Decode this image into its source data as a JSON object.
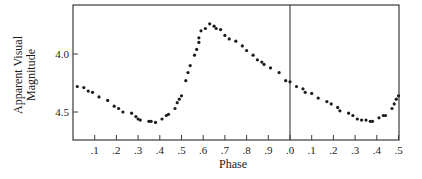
{
  "chart_data": {
    "type": "scatter",
    "title": "",
    "xlabel": "Phase",
    "ylabel": "Apparent Visual Magnitude",
    "ylabel_lines": [
      "Apparent Visual",
      "Magnitude"
    ],
    "xlim": [
      0.0,
      1.5
    ],
    "ylim": [
      4.74,
      3.58
    ],
    "y_inverted": true,
    "grid": false,
    "legend": null,
    "x_ticks": [
      0.1,
      0.2,
      0.3,
      0.4,
      0.5,
      0.6,
      0.7,
      0.8,
      0.9,
      1.0,
      1.1,
      1.2,
      1.3,
      1.4,
      1.5
    ],
    "x_tick_labels": [
      ".1",
      ".2",
      ".3",
      ".4",
      ".5",
      ".6",
      ".7",
      ".8",
      ".9",
      ".0",
      ".1",
      ".2",
      ".3",
      ".4",
      ".5"
    ],
    "y_ticks": [
      4.0,
      4.5
    ],
    "y_tick_labels": [
      "4.0",
      "4.5"
    ],
    "annotations": [
      {
        "type": "vertical-line",
        "x": 1.0,
        "label": "phase zero"
      }
    ],
    "series": [
      {
        "name": "light curve",
        "marker_color": "#1a1a1a",
        "x": [
          0.02,
          0.05,
          0.07,
          0.09,
          0.12,
          0.16,
          0.19,
          0.21,
          0.23,
          0.27,
          0.29,
          0.3,
          0.31,
          0.35,
          0.36,
          0.38,
          0.41,
          0.43,
          0.44,
          0.47,
          0.48,
          0.49,
          0.5,
          0.52,
          0.53,
          0.54,
          0.56,
          0.57,
          0.58,
          0.58,
          0.59,
          0.61,
          0.63,
          0.65,
          0.66,
          0.68,
          0.7,
          0.72,
          0.75,
          0.78,
          0.8,
          0.83,
          0.85,
          0.87,
          0.88,
          0.91,
          0.95,
          0.98,
          1.0,
          1.03,
          1.06,
          1.07,
          1.1,
          1.13,
          1.17,
          1.19,
          1.22,
          1.23,
          1.27,
          1.29,
          1.31,
          1.33,
          1.35,
          1.37,
          1.38,
          1.41,
          1.43,
          1.44,
          1.47,
          1.48,
          1.49,
          1.5
        ],
        "y": [
          4.28,
          4.29,
          4.32,
          4.33,
          4.37,
          4.4,
          4.45,
          4.47,
          4.5,
          4.51,
          4.54,
          4.56,
          4.57,
          4.58,
          4.58,
          4.59,
          4.56,
          4.53,
          4.52,
          4.47,
          4.42,
          4.39,
          4.36,
          4.23,
          4.16,
          4.1,
          4.01,
          3.96,
          3.9,
          3.86,
          3.8,
          3.78,
          3.74,
          3.76,
          3.78,
          3.79,
          3.84,
          3.87,
          3.89,
          3.93,
          3.97,
          4.01,
          4.05,
          4.07,
          4.09,
          4.12,
          4.16,
          4.23,
          4.24,
          4.28,
          4.3,
          4.33,
          4.34,
          4.38,
          4.41,
          4.43,
          4.46,
          4.49,
          4.51,
          4.53,
          4.56,
          4.57,
          4.57,
          4.58,
          4.58,
          4.55,
          4.53,
          4.53,
          4.47,
          4.43,
          4.39,
          4.36
        ]
      }
    ]
  },
  "colors": {
    "axis": "#3a3a3a",
    "marker": "#1a1a1a",
    "background": "#ffffff"
  }
}
